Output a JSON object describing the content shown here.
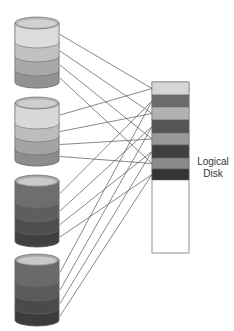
{
  "diagram": {
    "title": "",
    "logical_disk": {
      "label_line1": "Logical",
      "label_line2": "Disk",
      "x": 152,
      "y": 82,
      "width": 37,
      "height": 171,
      "stripes": [
        {
          "color": "#d6d6d6",
          "y": 82,
          "h": 13
        },
        {
          "color": "#6c6c6c",
          "y": 95,
          "h": 12
        },
        {
          "color": "#b2b2b2",
          "y": 107,
          "h": 13
        },
        {
          "color": "#555555",
          "y": 120,
          "h": 13
        },
        {
          "color": "#999999",
          "y": 133,
          "h": 12
        },
        {
          "color": "#404040",
          "y": 145,
          "h": 13
        },
        {
          "color": "#8a8a8a",
          "y": 158,
          "h": 11
        },
        {
          "color": "#343434",
          "y": 169,
          "h": 11
        }
      ]
    },
    "physical_disks": [
      {
        "name": "disk-1",
        "top": 17,
        "layer_tops": [
          29,
          42,
          56,
          70
        ],
        "bottom": 82,
        "layer_colors": [
          "#dcdcdc",
          "#c2c2c2",
          "#a9a9a9",
          "#929292"
        ],
        "cap_color": "#b8b8b8"
      },
      {
        "name": "disk-2",
        "top": 97,
        "layer_tops": [
          110,
          123,
          136,
          149
        ],
        "bottom": 160,
        "layer_colors": [
          "#d8d8d8",
          "#bdbdbd",
          "#a4a4a4",
          "#8c8c8c"
        ],
        "cap_color": "#b4b4b4"
      },
      {
        "name": "disk-3",
        "top": 175,
        "layer_tops": [
          188,
          202,
          216,
          229
        ],
        "bottom": 241,
        "layer_colors": [
          "#6e6e6e",
          "#5e5e5e",
          "#4e4e4e",
          "#404040"
        ],
        "cap_color": "#a8a8a8"
      },
      {
        "name": "disk-4",
        "top": 254,
        "layer_tops": [
          267,
          281,
          295,
          308
        ],
        "bottom": 320,
        "layer_colors": [
          "#6a6a6a",
          "#5a5a5a",
          "#4a4a4a",
          "#3c3c3c"
        ],
        "cap_color": "#a6a6a6"
      }
    ],
    "connections": [
      [
        0,
        0,
        0
      ],
      [
        0,
        1,
        2
      ],
      [
        0,
        2,
        4
      ],
      [
        0,
        3,
        6
      ],
      [
        1,
        0,
        0
      ],
      [
        1,
        1,
        2
      ],
      [
        1,
        2,
        4
      ],
      [
        1,
        3,
        6
      ],
      [
        2,
        0,
        1
      ],
      [
        2,
        1,
        3
      ],
      [
        2,
        2,
        5
      ],
      [
        2,
        3,
        7
      ],
      [
        3,
        0,
        1
      ],
      [
        3,
        1,
        3
      ],
      [
        3,
        2,
        5
      ],
      [
        3,
        3,
        7
      ]
    ],
    "line_color": "#555555"
  }
}
